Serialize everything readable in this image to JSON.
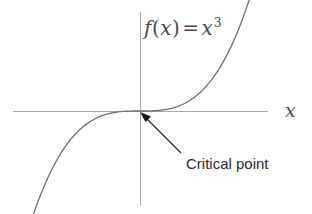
{
  "figure": {
    "background_color": "#ffffff",
    "axis_color": "#a8a8a8",
    "curve_color": "#6e6e73",
    "annotation_color": "#2b2b2b"
  },
  "labels": {
    "function_f": "f",
    "function_open_paren": "(",
    "function_var": "x",
    "function_close_paren": ")",
    "function_equals": "=",
    "function_rhs_base": "x",
    "function_rhs_exponent": "3",
    "function_full": "f(x) = x^3",
    "x_axis": "x",
    "annotation": "Critical point"
  },
  "chart_data": {
    "type": "line",
    "xlabel": "x",
    "ylabel": "",
    "grid": false,
    "legend": null,
    "function": "y = x^3",
    "xlim": [
      -2.55,
      2.55
    ],
    "ylim": [
      -10.5,
      10.5
    ],
    "origin_px": [
      140,
      111
    ],
    "x": [
      -2.5,
      -2.25,
      -2.0,
      -1.75,
      -1.5,
      -1.25,
      -1.0,
      -0.75,
      -0.5,
      -0.25,
      0.0,
      0.25,
      0.5,
      0.75,
      1.0,
      1.25,
      1.5,
      1.75,
      2.0,
      2.25,
      2.5
    ],
    "y": [
      -15.625,
      -11.39,
      -8.0,
      -5.359,
      -3.375,
      -1.953,
      -1.0,
      -0.422,
      -0.125,
      -0.0156,
      0.0,
      0.0156,
      0.125,
      0.422,
      1.0,
      1.953,
      3.375,
      5.359,
      8.0,
      11.39,
      15.625
    ],
    "annotations": [
      {
        "text": "Critical point",
        "point": [
          0,
          0
        ],
        "point_px": [
          140,
          112
        ],
        "label_px": [
          186,
          155
        ],
        "arrow_tail_px": [
          181,
          153
        ],
        "arrow_head_px": [
          141,
          113
        ]
      }
    ]
  },
  "axes": {
    "x_axis_px": {
      "x1": 13,
      "y1": 111,
      "x2": 268,
      "y2": 111
    },
    "y_axis_px": {
      "x1": 140,
      "y1": 12,
      "x2": 140,
      "y2": 206
    }
  }
}
